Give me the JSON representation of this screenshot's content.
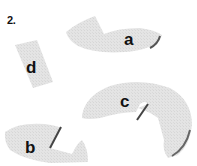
{
  "question": {
    "number": "2."
  },
  "pieces": [
    {
      "id": "a",
      "label": "a",
      "shape": "arc-segment-with-notch"
    },
    {
      "id": "b",
      "label": "b",
      "shape": "arc-segment-with-notch"
    },
    {
      "id": "c",
      "label": "c",
      "shape": "ring-with-notch"
    },
    {
      "id": "d",
      "label": "d",
      "shape": "rectangular-block"
    }
  ],
  "colors": {
    "piece_fill": "#e2e2e2",
    "piece_edge": "#8a8a8a",
    "piece_shadow": "#555555",
    "label": "#111111"
  }
}
